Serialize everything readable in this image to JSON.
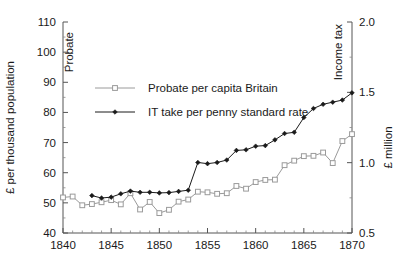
{
  "chart_data": {
    "type": "line",
    "title": "",
    "subtitle": "",
    "xlabel": "",
    "ylabel": "£ per thousand population",
    "y2label": "£ million",
    "xlim": [
      1840,
      1870
    ],
    "ylim": [
      40,
      110
    ],
    "y2lim": [
      0.5,
      2.0
    ],
    "grid": false,
    "legend_position": "upper-left-inside",
    "x_ticks": [
      1840,
      1845,
      1850,
      1855,
      1860,
      1865,
      1870
    ],
    "x_tick_labels": [
      "1840",
      "1845",
      "1850",
      "1855",
      "1860",
      "1865",
      "1870"
    ],
    "x_minor_step": 1,
    "y_ticks": [
      40,
      50,
      60,
      70,
      80,
      90,
      100,
      110
    ],
    "y_tick_labels": [
      "40",
      "50",
      "60",
      "70",
      "80",
      "90",
      "100",
      "110"
    ],
    "y2_ticks": [
      0.5,
      1.0,
      1.5,
      2.0
    ],
    "y2_tick_labels": [
      "0.5",
      "1.0",
      "1.5",
      "2.0"
    ],
    "x": [
      1840,
      1841,
      1842,
      1843,
      1844,
      1845,
      1846,
      1847,
      1848,
      1849,
      1850,
      1851,
      1852,
      1853,
      1854,
      1855,
      1856,
      1857,
      1858,
      1859,
      1860,
      1861,
      1862,
      1863,
      1864,
      1865,
      1866,
      1867,
      1868,
      1869,
      1870
    ],
    "series": [
      {
        "name": "Probate per capita Britain",
        "axis": "left",
        "color": "#9a9a9a",
        "marker": "open-square",
        "values": [
          51.8,
          52.1,
          49.2,
          49.6,
          50.2,
          50.9,
          49.5,
          53.2,
          47.8,
          50.3,
          46.6,
          47.7,
          50.4,
          51.1,
          53.7,
          53.5,
          53.0,
          53.2,
          55.6,
          54.7,
          56.9,
          57.6,
          57.7,
          62.5,
          64.0,
          65.5,
          65.6,
          66.7,
          63.2,
          70.5,
          72.8
        ]
      },
      {
        "name": "IT take per penny standard rate",
        "axis": "right",
        "color": "#1a1a1a",
        "marker": "filled-diamond",
        "values": [
          null,
          null,
          null,
          52.4,
          51.6,
          51.9,
          53.0,
          53.9,
          53.5,
          53.5,
          53.3,
          53.4,
          53.8,
          54.2,
          63.4,
          63.0,
          63.4,
          64.2,
          67.4,
          67.6,
          68.8,
          69.0,
          70.9,
          73.0,
          73.4,
          78.3,
          81.3,
          82.7,
          83.4,
          84.1,
          86.5
        ]
      }
    ],
    "annotations": [
      {
        "text": "Probate",
        "x": 1841,
        "y": 100,
        "rotation": -90
      },
      {
        "text": "Income tax",
        "x": 1869,
        "y": 100,
        "rotation": -90
      }
    ]
  },
  "legend": {
    "items": [
      {
        "label": "Probate per capita Britain"
      },
      {
        "label": "IT take per penny standard rate"
      }
    ]
  }
}
